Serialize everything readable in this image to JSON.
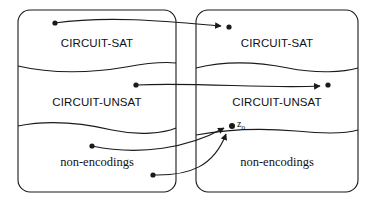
{
  "figure": {
    "type": "set-mapping-diagram",
    "stroke_color": "#1a1a1a",
    "background_color": "#ffffff",
    "boxes": [
      {
        "id": "left-box",
        "x": 18,
        "y": 10,
        "width": 158,
        "height": 182,
        "corner_radius": 12,
        "regions": [
          {
            "id": "left-circuit-sat",
            "label": "CIRCUIT-SAT",
            "font": "sans",
            "cx": 97,
            "cy": 43
          },
          {
            "id": "left-circuit-unsat",
            "label": "CIRCUIT-UNSAT",
            "font": "sans",
            "cx": 97,
            "cy": 102
          },
          {
            "id": "left-non-encodings",
            "label": "non-encodings",
            "font": "serif",
            "cx": 97,
            "cy": 162
          }
        ]
      },
      {
        "id": "right-box",
        "x": 196,
        "y": 10,
        "width": 162,
        "height": 182,
        "corner_radius": 12,
        "regions": [
          {
            "id": "right-circuit-sat",
            "label": "CIRCUIT-SAT",
            "font": "sans",
            "cx": 277,
            "cy": 43
          },
          {
            "id": "right-circuit-unsat",
            "label": "CIRCUIT-UNSAT",
            "font": "sans",
            "cx": 277,
            "cy": 102
          },
          {
            "id": "right-non-encodings",
            "label": "non-encodings",
            "font": "serif",
            "cx": 277,
            "cy": 162
          }
        ]
      }
    ],
    "points": [
      {
        "id": "src-sat",
        "cx": 55,
        "cy": 23,
        "r": 2.6,
        "box": "left-box",
        "region": "left-circuit-sat"
      },
      {
        "id": "src-unsat",
        "cx": 136,
        "cy": 85,
        "r": 2.6,
        "box": "left-box",
        "region": "left-circuit-unsat"
      },
      {
        "id": "src-nonenc-upper",
        "cx": 92,
        "cy": 146,
        "r": 2.6,
        "box": "left-box",
        "region": "left-non-encodings"
      },
      {
        "id": "src-nonenc-lower",
        "cx": 153,
        "cy": 175,
        "r": 2.6,
        "box": "left-box",
        "region": "left-non-encodings"
      },
      {
        "id": "dst-sat",
        "cx": 229,
        "cy": 27,
        "r": 2.6,
        "box": "right-box",
        "region": "right-circuit-sat"
      },
      {
        "id": "dst-unsat",
        "cx": 328,
        "cy": 85,
        "r": 2.6,
        "box": "right-box",
        "region": "right-circuit-unsat"
      },
      {
        "id": "dst-z0",
        "cx": 232,
        "cy": 126,
        "r": 3.0,
        "box": "right-box",
        "region": "right-circuit-unsat",
        "label": "z",
        "label_sub": "0"
      }
    ],
    "arrows": [
      {
        "id": "arrow-sat-to-sat",
        "from": "src-sat",
        "to": "dst-sat"
      },
      {
        "id": "arrow-unsat-to-unsat",
        "from": "src-unsat",
        "to": "dst-unsat"
      },
      {
        "id": "arrow-nonenc-upper-to-z0",
        "from": "src-nonenc-upper",
        "to": "dst-z0"
      },
      {
        "id": "arrow-nonenc-lower-to-z0",
        "from": "src-nonenc-lower",
        "to": "dst-z0"
      }
    ]
  }
}
